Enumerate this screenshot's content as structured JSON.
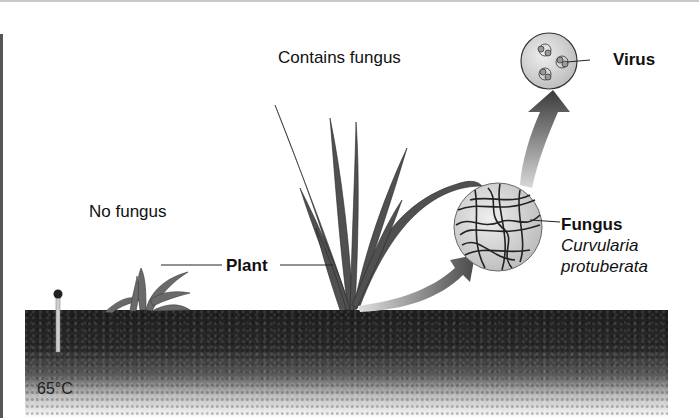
{
  "figure": {
    "labels": {
      "contains_fungus": "Contains fungus",
      "no_fungus": "No fungus",
      "plant": "Plant",
      "virus": "Virus",
      "fungus": "Fungus",
      "fungus_species_line1": "Curvularia",
      "fungus_species_line2": "protuberata",
      "soil_temperature": "65°C"
    },
    "elements": {
      "thermometer-icon": "thermometer",
      "virus-circle": "virus particles magnified",
      "fungus-circle": "fungal hyphae magnified",
      "arrow-plant-to-fungus": "curved arrow",
      "arrow-fungus-to-virus": "curved arrow"
    },
    "colors": {
      "soil": "#222222",
      "text": "#111111",
      "leaf": "#4a4a4a",
      "arrow": "#5a5a5a"
    }
  }
}
